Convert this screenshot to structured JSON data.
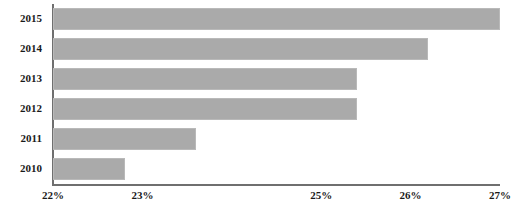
{
  "chart_data": {
    "type": "bar",
    "orientation": "horizontal",
    "title": "",
    "subtitle": "",
    "xlabel": "",
    "ylabel": "",
    "categories": [
      "2015",
      "2014",
      "2013",
      "2012",
      "2011",
      "2010"
    ],
    "values": [
      27.0,
      26.2,
      25.4,
      25.4,
      23.6,
      22.8
    ],
    "value_suffix": "%",
    "xlim": [
      22,
      27
    ],
    "ylim": null,
    "grid": false,
    "legend": null,
    "legend_position": "none",
    "series": [
      {
        "name": "",
        "values": [
          27.0,
          26.2,
          25.4,
          25.4,
          23.6,
          22.8
        ]
      }
    ],
    "xticks": [
      22,
      23,
      24,
      25,
      26,
      27
    ],
    "xtick_labels": [
      "22%",
      "23%",
      "",
      "25%",
      "26%",
      "27%"
    ],
    "annotations": []
  },
  "style": {
    "bar_fill": "#aaaaaa",
    "bar_border": "#b9b9b9",
    "axis_color": "#6f6f6f",
    "text_color": "#1a1a1a",
    "background": "#ffffff"
  },
  "axis": {
    "y_axis_name": "category-axis",
    "x_axis_name": "value-axis"
  }
}
